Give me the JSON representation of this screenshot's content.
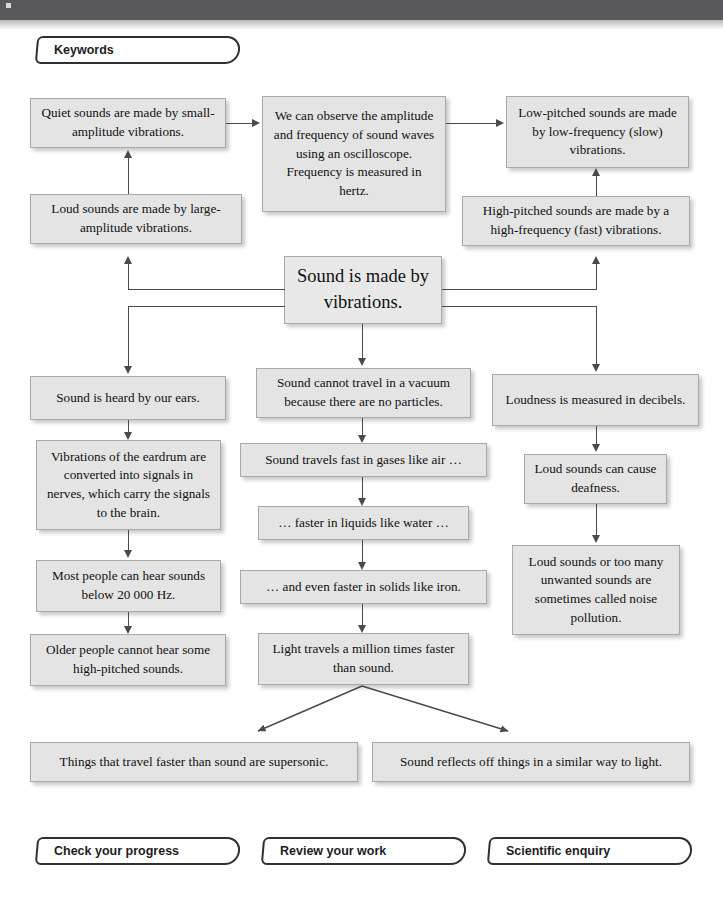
{
  "header": {
    "banner_color": "#59595b",
    "keywords_tab": "Keywords"
  },
  "theme": {
    "box_fill": "#e4e4e4",
    "box_border": "#a9a9a9",
    "connector_color": "#4a4a4a",
    "page_background": "#ffffff",
    "tab_border": "#2f3033"
  },
  "diagram": {
    "title": "Sound is made by vibrations.",
    "nodes": {
      "quiet": "Quiet sounds are made by small-amplitude vibrations.",
      "oscilloscope": "We can observe the amplitude and frequency of sound waves using an oscilloscope. Frequency is measured in hertz.",
      "low_pitched": "Low-pitched sounds are made by low-frequency (slow) vibrations.",
      "loud": "Loud sounds are made by large-amplitude vibrations.",
      "high_pitched": "High-pitched sounds are made by a high-frequency (fast) vibrations.",
      "center": "Sound is made by vibrations.",
      "ears": "Sound is heard by our ears.",
      "eardrum": "Vibrations of the eardrum are converted into signals in nerves, which carry the signals to the brain.",
      "hearing_range": "Most people can hear sounds below 20 000 Hz.",
      "older_people": "Older people cannot hear some high-pitched sounds.",
      "vacuum": "Sound cannot travel in a vacuum because there are no particles.",
      "gases": "Sound travels fast in gases like air …",
      "liquids": "… faster in liquids like water …",
      "solids": "… and even faster in solids like iron.",
      "light_speed": "Light travels a million times faster than sound.",
      "loudness": "Loudness is measured in decibels.",
      "deafness": "Loud sounds can cause deafness.",
      "noise_pollution": "Loud sounds or too many unwanted sounds are sometimes called noise pollution.",
      "supersonic": "Things that travel faster than sound are supersonic.",
      "reflection": "Sound reflects off things in a similar way to light."
    }
  },
  "footer": {
    "tabs": [
      {
        "label": "Check your progress"
      },
      {
        "label": "Review your work"
      },
      {
        "label": "Scientific enquiry"
      }
    ]
  }
}
